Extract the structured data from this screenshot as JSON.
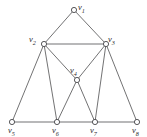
{
  "figure": {
    "type": "undirected-graph-diagram",
    "background_color": "#ffffff",
    "edge_color": "#58585a",
    "node_fill_color": "#ffffff",
    "node_stroke_color": "#46464a",
    "label_color": "#2b2b2d"
  },
  "graph_data": {
    "type": "graph",
    "vertex_count": 8,
    "edge_count": 14,
    "nodes": [
      {
        "id": "v1",
        "label_base": "v",
        "label_sub": "1",
        "x": 74,
        "y": 10,
        "r": 2.6,
        "label_x": 78,
        "label_y": 3,
        "degree": 2
      },
      {
        "id": "v2",
        "label_base": "v",
        "label_sub": "2",
        "x": 44,
        "y": 44,
        "r": 2.6,
        "label_x": 29,
        "label_y": 35,
        "degree": 5
      },
      {
        "id": "v3",
        "label_base": "v",
        "label_sub": "3",
        "x": 106,
        "y": 44,
        "r": 2.6,
        "label_x": 108,
        "label_y": 35,
        "degree": 5
      },
      {
        "id": "v4",
        "label_base": "v",
        "label_sub": "4",
        "x": 77,
        "y": 80,
        "r": 2.6,
        "label_x": 70,
        "label_y": 66,
        "degree": 4
      },
      {
        "id": "v5",
        "label_base": "v",
        "label_sub": "5",
        "x": 12,
        "y": 122,
        "r": 2.6,
        "label_x": 8,
        "label_y": 126,
        "degree": 2
      },
      {
        "id": "v6",
        "label_base": "v",
        "label_sub": "6",
        "x": 57,
        "y": 122,
        "r": 2.6,
        "label_x": 52,
        "label_y": 126,
        "degree": 4
      },
      {
        "id": "v7",
        "label_base": "v",
        "label_sub": "7",
        "x": 95,
        "y": 122,
        "r": 2.6,
        "label_x": 90,
        "label_y": 126,
        "degree": 4
      },
      {
        "id": "v8",
        "label_base": "v",
        "label_sub": "8",
        "x": 137,
        "y": 122,
        "r": 2.6,
        "label_x": 132,
        "label_y": 126,
        "degree": 2
      }
    ],
    "edges": [
      {
        "from": "v1",
        "to": "v2",
        "x1": 74,
        "y1": 10,
        "x2": 44,
        "y2": 44
      },
      {
        "from": "v1",
        "to": "v3",
        "x1": 74,
        "y1": 10,
        "x2": 106,
        "y2": 44
      },
      {
        "from": "v2",
        "to": "v3",
        "x1": 44,
        "y1": 44,
        "x2": 106,
        "y2": 44
      },
      {
        "from": "v2",
        "to": "v4",
        "x1": 44,
        "y1": 44,
        "x2": 77,
        "y2": 80
      },
      {
        "from": "v3",
        "to": "v4",
        "x1": 106,
        "y1": 44,
        "x2": 77,
        "y2": 80
      },
      {
        "from": "v2",
        "to": "v5",
        "x1": 44,
        "y1": 44,
        "x2": 12,
        "y2": 122
      },
      {
        "from": "v2",
        "to": "v6",
        "x1": 44,
        "y1": 44,
        "x2": 57,
        "y2": 122
      },
      {
        "from": "v3",
        "to": "v7",
        "x1": 106,
        "y1": 44,
        "x2": 95,
        "y2": 122
      },
      {
        "from": "v3",
        "to": "v8",
        "x1": 106,
        "y1": 44,
        "x2": 137,
        "y2": 122
      },
      {
        "from": "v4",
        "to": "v6",
        "x1": 77,
        "y1": 80,
        "x2": 57,
        "y2": 122
      },
      {
        "from": "v4",
        "to": "v7",
        "x1": 77,
        "y1": 80,
        "x2": 95,
        "y2": 122
      },
      {
        "from": "v5",
        "to": "v6",
        "x1": 12,
        "y1": 122,
        "x2": 57,
        "y2": 122
      },
      {
        "from": "v6",
        "to": "v7",
        "x1": 57,
        "y1": 122,
        "x2": 95,
        "y2": 122
      },
      {
        "from": "v7",
        "to": "v8",
        "x1": 95,
        "y1": 122,
        "x2": 137,
        "y2": 122
      }
    ]
  }
}
